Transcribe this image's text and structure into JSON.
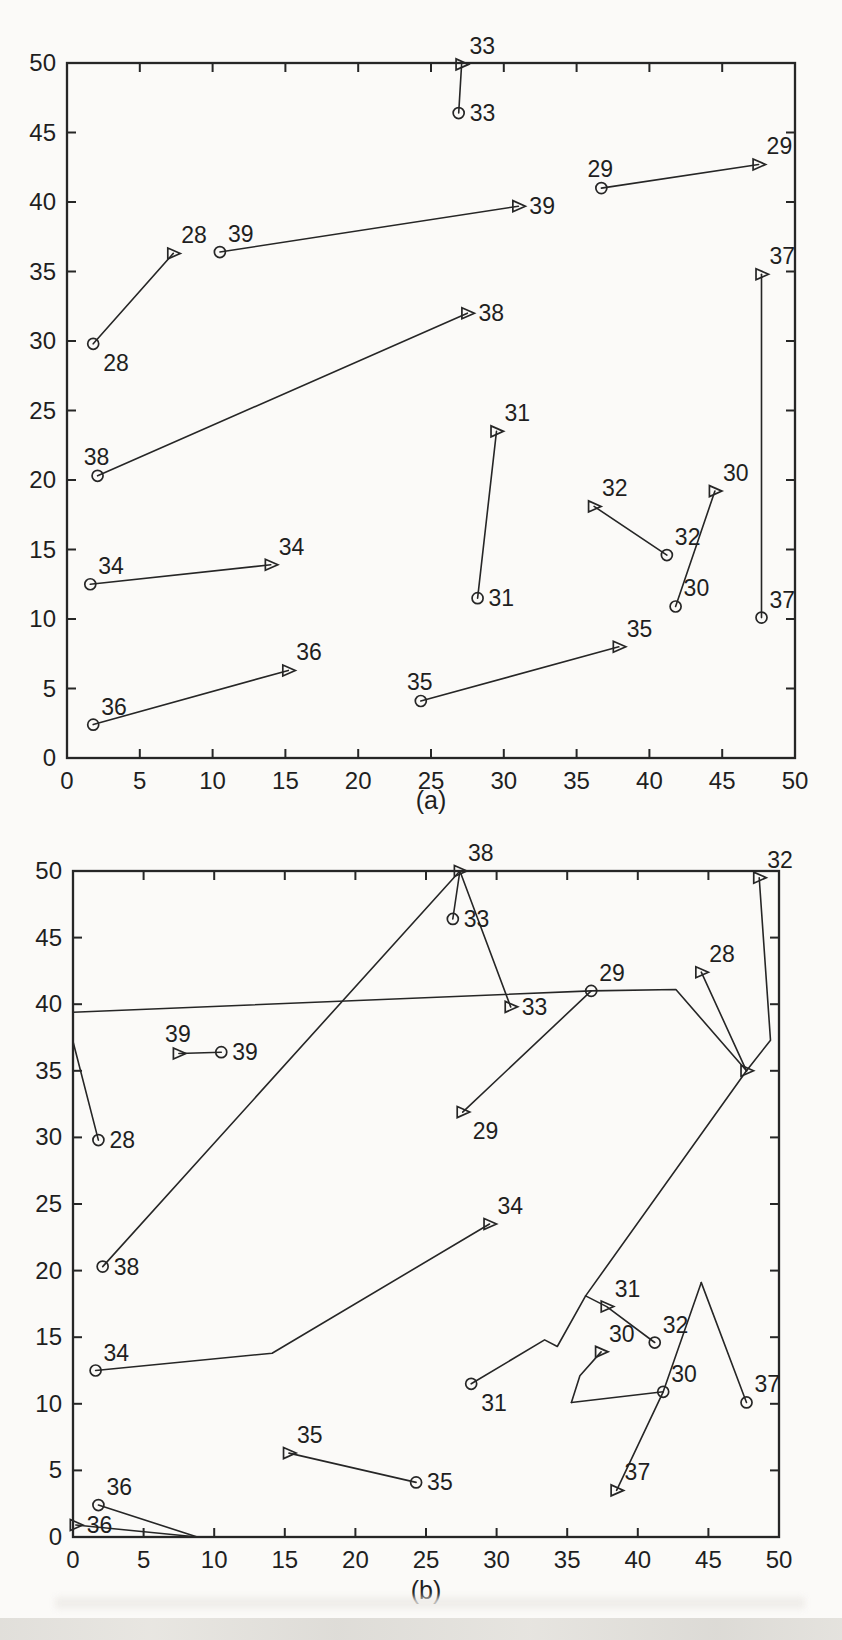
{
  "figure": {
    "colors": {
      "ink": "#262626",
      "paper": "#fbfaf8"
    }
  },
  "chart_data": [
    {
      "id": "a",
      "type": "scatter",
      "caption": "(a)",
      "xlim": [
        0,
        50
      ],
      "ylim": [
        0,
        50
      ],
      "xticks": [
        0,
        5,
        10,
        15,
        20,
        25,
        30,
        35,
        40,
        45,
        50
      ],
      "yticks": [
        0,
        5,
        10,
        15,
        20,
        25,
        30,
        35,
        40,
        45,
        50
      ],
      "grid": false,
      "points": [
        {
          "label": "28",
          "marker": "circle",
          "x": 1.8,
          "y": 29.8,
          "label_pos": "below-right"
        },
        {
          "label": "28",
          "marker": "triangle",
          "x": 7.3,
          "y": 36.3,
          "label_pos": "above-right"
        },
        {
          "label": "39",
          "marker": "circle",
          "x": 10.5,
          "y": 36.4,
          "label_pos": "above-right"
        },
        {
          "label": "39",
          "marker": "triangle",
          "x": 31.0,
          "y": 39.7,
          "label_pos": "right"
        },
        {
          "label": "33",
          "marker": "triangle",
          "x": 27.1,
          "y": 49.9,
          "label_pos": "above-right"
        },
        {
          "label": "33",
          "marker": "circle",
          "x": 26.9,
          "y": 46.4,
          "label_pos": "right"
        },
        {
          "label": "29",
          "marker": "circle",
          "x": 36.7,
          "y": 41.0,
          "label_pos": "above"
        },
        {
          "label": "29",
          "marker": "triangle",
          "x": 47.5,
          "y": 42.7,
          "label_pos": "above-right"
        },
        {
          "label": "37",
          "marker": "triangle",
          "x": 47.7,
          "y": 34.8,
          "label_pos": "above-right"
        },
        {
          "label": "37",
          "marker": "circle",
          "x": 47.7,
          "y": 10.1,
          "label_pos": "above-right"
        },
        {
          "label": "38",
          "marker": "triangle",
          "x": 27.5,
          "y": 32.0,
          "label_pos": "right"
        },
        {
          "label": "38",
          "marker": "circle",
          "x": 2.1,
          "y": 20.3,
          "label_pos": "above"
        },
        {
          "label": "34",
          "marker": "circle",
          "x": 1.6,
          "y": 12.5,
          "label_pos": "above-right"
        },
        {
          "label": "34",
          "marker": "triangle",
          "x": 14.0,
          "y": 13.9,
          "label_pos": "above-right"
        },
        {
          "label": "36",
          "marker": "circle",
          "x": 1.8,
          "y": 2.4,
          "label_pos": "above-right"
        },
        {
          "label": "36",
          "marker": "triangle",
          "x": 15.2,
          "y": 6.3,
          "label_pos": "above-right"
        },
        {
          "label": "35",
          "marker": "circle",
          "x": 24.3,
          "y": 4.1,
          "label_pos": "above"
        },
        {
          "label": "35",
          "marker": "triangle",
          "x": 37.9,
          "y": 8.0,
          "label_pos": "above-right"
        },
        {
          "label": "31",
          "marker": "triangle",
          "x": 29.5,
          "y": 23.5,
          "label_pos": "above-right"
        },
        {
          "label": "31",
          "marker": "circle",
          "x": 28.2,
          "y": 11.5,
          "label_pos": "right"
        },
        {
          "label": "32",
          "marker": "triangle",
          "x": 36.2,
          "y": 18.1,
          "label_pos": "above-right"
        },
        {
          "label": "32",
          "marker": "circle",
          "x": 41.2,
          "y": 14.6,
          "label_pos": "above-right"
        },
        {
          "label": "30",
          "marker": "triangle",
          "x": 44.5,
          "y": 19.2,
          "label_pos": "above-right"
        },
        {
          "label": "30",
          "marker": "circle",
          "x": 41.8,
          "y": 10.9,
          "label_pos": "above-right"
        }
      ],
      "paths": [
        [
          [
            1.8,
            29.8
          ],
          [
            7.3,
            36.3
          ]
        ],
        [
          [
            10.5,
            36.4
          ],
          [
            31.0,
            39.7
          ]
        ],
        [
          [
            26.9,
            46.4
          ],
          [
            27.1,
            49.9
          ]
        ],
        [
          [
            36.7,
            41.0
          ],
          [
            47.5,
            42.7
          ]
        ],
        [
          [
            47.7,
            10.1
          ],
          [
            47.7,
            34.8
          ]
        ],
        [
          [
            2.1,
            20.3
          ],
          [
            27.5,
            32.0
          ]
        ],
        [
          [
            1.6,
            12.5
          ],
          [
            14.0,
            13.9
          ]
        ],
        [
          [
            1.8,
            2.4
          ],
          [
            15.2,
            6.3
          ]
        ],
        [
          [
            24.3,
            4.1
          ],
          [
            37.9,
            8.0
          ]
        ],
        [
          [
            28.2,
            11.5
          ],
          [
            29.5,
            23.5
          ]
        ],
        [
          [
            41.2,
            14.6
          ],
          [
            36.2,
            18.1
          ]
        ],
        [
          [
            41.8,
            10.9
          ],
          [
            44.5,
            19.2
          ]
        ]
      ]
    },
    {
      "id": "b",
      "type": "scatter",
      "caption": "(b)",
      "xlim": [
        0,
        50
      ],
      "ylim": [
        0,
        50
      ],
      "xticks": [
        0,
        5,
        10,
        15,
        20,
        25,
        30,
        35,
        40,
        45,
        50
      ],
      "yticks": [
        0,
        5,
        10,
        15,
        20,
        25,
        30,
        35,
        40,
        45,
        50
      ],
      "grid": false,
      "points": [
        {
          "label": "38",
          "marker": "triangle",
          "x": 27.4,
          "y": 50.0,
          "label_pos": "above-right"
        },
        {
          "label": "33",
          "marker": "circle",
          "x": 26.9,
          "y": 46.4,
          "label_pos": "right"
        },
        {
          "label": "32",
          "marker": "triangle",
          "x": 48.6,
          "y": 49.5,
          "label_pos": "above-right"
        },
        {
          "label": "33",
          "marker": "triangle",
          "x": 31.0,
          "y": 39.8,
          "label_pos": "right"
        },
        {
          "label": "29",
          "marker": "circle",
          "x": 36.7,
          "y": 41.0,
          "label_pos": "above-right"
        },
        {
          "label": "28",
          "marker": "triangle",
          "x": 44.5,
          "y": 42.4,
          "label_pos": "above-right"
        },
        {
          "label": "39",
          "marker": "triangle",
          "x": 7.5,
          "y": 36.3,
          "label_pos": "above"
        },
        {
          "label": "39",
          "marker": "circle",
          "x": 10.5,
          "y": 36.4,
          "label_pos": "right"
        },
        {
          "label": "28",
          "marker": "circle",
          "x": 1.8,
          "y": 29.8,
          "label_pos": "right"
        },
        {
          "label": "29",
          "marker": "triangle",
          "x": 27.6,
          "y": 31.9,
          "label_pos": "below-right"
        },
        {
          "label": "",
          "marker": "triangle",
          "x": 47.7,
          "y": 35.0,
          "label_pos": "right"
        },
        {
          "label": "34",
          "marker": "triangle",
          "x": 29.5,
          "y": 23.5,
          "label_pos": "above-right"
        },
        {
          "label": "38",
          "marker": "circle",
          "x": 2.1,
          "y": 20.3,
          "label_pos": "right"
        },
        {
          "label": "31",
          "marker": "triangle",
          "x": 37.8,
          "y": 17.3,
          "label_pos": "above-right"
        },
        {
          "label": "32",
          "marker": "circle",
          "x": 41.2,
          "y": 14.6,
          "label_pos": "above-right"
        },
        {
          "label": "30",
          "marker": "triangle",
          "x": 37.4,
          "y": 13.9,
          "label_pos": "above-right"
        },
        {
          "label": "34",
          "marker": "circle",
          "x": 1.6,
          "y": 12.5,
          "label_pos": "above-right"
        },
        {
          "label": "31",
          "marker": "circle",
          "x": 28.2,
          "y": 11.5,
          "label_pos": "below-right"
        },
        {
          "label": "30",
          "marker": "circle",
          "x": 41.8,
          "y": 10.9,
          "label_pos": "above-right"
        },
        {
          "label": "37",
          "marker": "circle",
          "x": 47.7,
          "y": 10.1,
          "label_pos": "above-right"
        },
        {
          "label": "35",
          "marker": "triangle",
          "x": 15.3,
          "y": 6.3,
          "label_pos": "above-right"
        },
        {
          "label": "35",
          "marker": "circle",
          "x": 24.3,
          "y": 4.1,
          "label_pos": "right"
        },
        {
          "label": "37",
          "marker": "triangle",
          "x": 38.5,
          "y": 3.5,
          "label_pos": "above-right"
        },
        {
          "label": "36",
          "marker": "circle",
          "x": 1.8,
          "y": 2.4,
          "label_pos": "above-right"
        },
        {
          "label": "36",
          "marker": "triangle",
          "x": 0.2,
          "y": 0.9,
          "label_pos": "right"
        }
      ],
      "paths": [
        [
          [
            0,
            39.4
          ],
          [
            36.7,
            41.0
          ],
          [
            42.7,
            41.1
          ],
          [
            47.7,
            35.0
          ]
        ],
        [
          [
            36.7,
            41.0
          ],
          [
            27.6,
            31.9
          ]
        ],
        [
          [
            0,
            37.2
          ],
          [
            1.8,
            29.8
          ]
        ],
        [
          [
            2.1,
            20.3
          ],
          [
            27.4,
            50.0
          ]
        ],
        [
          [
            27.4,
            50.0
          ],
          [
            26.9,
            46.4
          ]
        ],
        [
          [
            27.4,
            50.0
          ],
          [
            31.0,
            39.8
          ]
        ],
        [
          [
            7.5,
            36.3
          ],
          [
            10.5,
            36.4
          ]
        ],
        [
          [
            48.6,
            49.5
          ],
          [
            49.4,
            37.3
          ],
          [
            47.7,
            35.0
          ]
        ],
        [
          [
            44.5,
            42.4
          ],
          [
            47.7,
            35.0
          ]
        ],
        [
          [
            47.7,
            35.0
          ],
          [
            36.3,
            18.1
          ],
          [
            37.8,
            17.3
          ],
          [
            41.2,
            14.6
          ]
        ],
        [
          [
            28.2,
            11.5
          ],
          [
            33.4,
            14.8
          ],
          [
            34.3,
            14.3
          ],
          [
            36.3,
            18.1
          ]
        ],
        [
          [
            1.6,
            12.5
          ],
          [
            14.1,
            13.8
          ],
          [
            29.5,
            23.5
          ]
        ],
        [
          [
            15.3,
            6.3
          ],
          [
            24.3,
            4.1
          ]
        ],
        [
          [
            1.8,
            2.4
          ],
          [
            8.8,
            0.0
          ]
        ],
        [
          [
            0.2,
            0.9
          ],
          [
            8.8,
            0.0
          ]
        ],
        [
          [
            44.5,
            19.1
          ],
          [
            47.7,
            10.1
          ]
        ],
        [
          [
            44.5,
            19.1
          ],
          [
            41.8,
            10.9
          ],
          [
            38.5,
            3.5
          ]
        ],
        [
          [
            35.3,
            10.1
          ],
          [
            41.8,
            10.9
          ]
        ],
        [
          [
            37.4,
            13.9
          ],
          [
            35.9,
            12.1
          ],
          [
            35.3,
            10.1
          ]
        ]
      ]
    }
  ]
}
